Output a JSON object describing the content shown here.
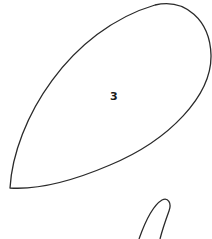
{
  "diagram": {
    "regions": [
      {
        "id": "region-3",
        "label": "3",
        "label_position": {
          "x": 110,
          "y": 91
        }
      },
      {
        "id": "region-partial",
        "label": ""
      }
    ],
    "stroke_color": "#2a2a2a",
    "background_color": "#ffffff"
  }
}
